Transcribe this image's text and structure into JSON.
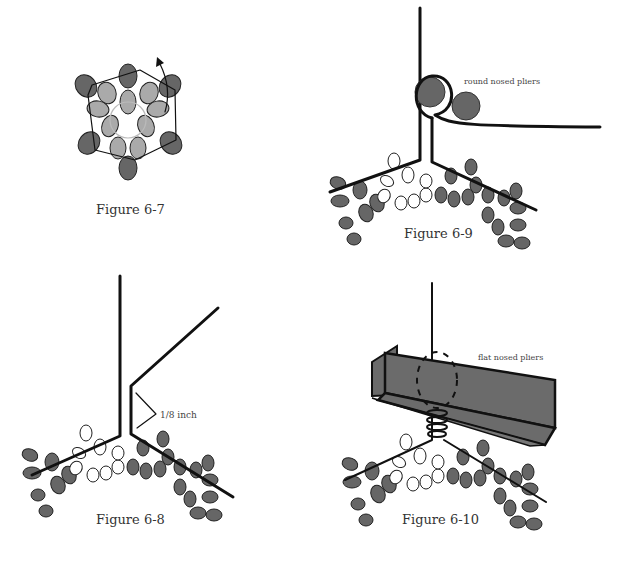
{
  "figures": {
    "fig_6_7": {
      "caption": "Figure 6-7"
    },
    "fig_6_9": {
      "caption": "Figure 6-9",
      "label": "round nosed pliers"
    },
    "fig_6_8": {
      "caption": "Figure 6-8",
      "label": "1/8 inch"
    },
    "fig_6_10": {
      "caption": "Figure 6-10",
      "label": "flat nosed pliers"
    }
  },
  "colors": {
    "dark_bead": "#666666",
    "light_bead": "#aaaaaa",
    "wire": "#111111",
    "pliers": "#6b6b6b"
  }
}
